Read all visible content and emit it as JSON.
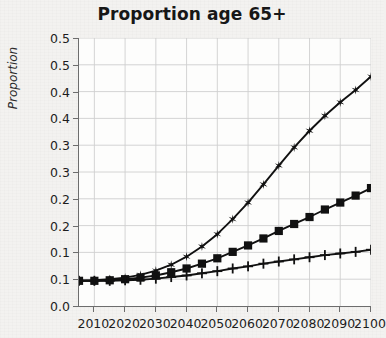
{
  "chart_data": {
    "type": "line",
    "title": "Proportion age 65+",
    "xlabel": "",
    "ylabel": "Proportion",
    "grid": true,
    "legend": "none",
    "xlim": [
      2005,
      2100
    ],
    "ylim": [
      0.0,
      0.5
    ],
    "ytick_values": [
      0.0,
      0.05,
      0.1,
      0.15,
      0.2,
      0.25,
      0.3,
      0.35,
      0.4,
      0.45,
      0.5
    ],
    "ytick_labels": [
      "0.0",
      "0.1",
      "0.1",
      "0.2",
      "0.2",
      "0.3",
      "0.3",
      "0.4",
      "0.4",
      "0.5"
    ],
    "ytick_labels_full": [
      "0.0",
      "0.1",
      "0.1",
      "0.2",
      "0.2",
      "0.3",
      "0.3",
      "0.4",
      "0.4",
      "0.5"
    ],
    "xtick_labels": [
      "2010",
      "2020",
      "2030",
      "2040",
      "2050",
      "2060",
      "2070",
      "2080",
      "2090",
      "2100"
    ],
    "xtick_values": [
      2010,
      2020,
      2030,
      2040,
      2050,
      2060,
      2070,
      2080,
      2090,
      2100
    ],
    "x": [
      2005,
      2010,
      2015,
      2020,
      2025,
      2030,
      2035,
      2040,
      2045,
      2050,
      2055,
      2060,
      2065,
      2070,
      2075,
      2080,
      2085,
      2090,
      2095,
      2100
    ],
    "series": [
      {
        "name": "high-scenario",
        "marker": "star",
        "color": "#111111",
        "values": [
          0.047,
          0.048,
          0.05,
          0.053,
          0.058,
          0.066,
          0.077,
          0.092,
          0.111,
          0.134,
          0.162,
          0.193,
          0.227,
          0.262,
          0.296,
          0.327,
          0.355,
          0.38,
          0.403,
          0.428
        ]
      },
      {
        "name": "mid-scenario",
        "marker": "square",
        "color": "#111111",
        "values": [
          0.047,
          0.047,
          0.048,
          0.05,
          0.053,
          0.057,
          0.063,
          0.07,
          0.079,
          0.089,
          0.101,
          0.113,
          0.126,
          0.14,
          0.153,
          0.166,
          0.18,
          0.193,
          0.206,
          0.22
        ]
      },
      {
        "name": "low-scenario",
        "marker": "plus",
        "color": "#111111",
        "values": [
          0.047,
          0.047,
          0.047,
          0.048,
          0.049,
          0.051,
          0.054,
          0.057,
          0.061,
          0.065,
          0.07,
          0.074,
          0.079,
          0.083,
          0.087,
          0.091,
          0.095,
          0.098,
          0.101,
          0.105
        ]
      }
    ]
  }
}
